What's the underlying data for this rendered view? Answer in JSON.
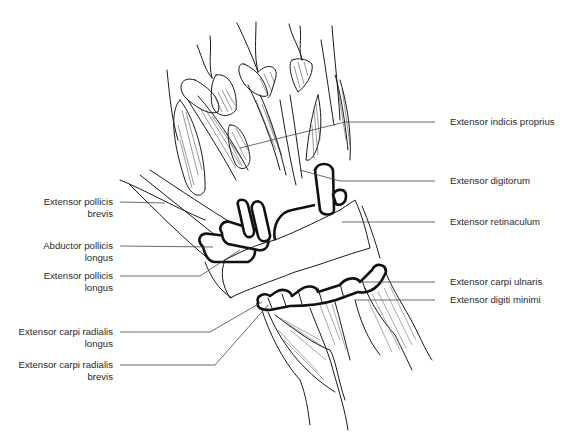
{
  "figure": {
    "labels_left": [
      {
        "id": "epb",
        "line1": "Extensor pollicis",
        "line2": "brevis"
      },
      {
        "id": "apl",
        "line1": "Abductor pollicis",
        "line2": "longus"
      },
      {
        "id": "epl",
        "line1": "Extensor pollicis",
        "line2": "longus"
      },
      {
        "id": "ecrl",
        "line1": "Extensor carpi radialis",
        "line2": "longus"
      },
      {
        "id": "ecrb",
        "line1": "Extensor carpi radialis",
        "line2": "brevis"
      }
    ],
    "labels_right": [
      {
        "id": "eip",
        "text": "Extensor indicis proprius"
      },
      {
        "id": "ed",
        "text": "Extensor digitorum"
      },
      {
        "id": "er",
        "text": "Extensor retinaculum"
      },
      {
        "id": "ecu",
        "text": "Extensor carpi ulnaris"
      },
      {
        "id": "edm",
        "text": "Extensor digiti minimi"
      }
    ]
  }
}
